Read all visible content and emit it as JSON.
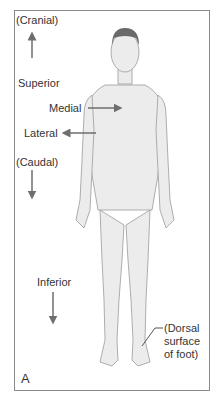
{
  "figure": {
    "panel_label": "A",
    "labels": {
      "cranial": "(Cranial)",
      "superior": "Superior",
      "medial": "Medial",
      "lateral": "Lateral",
      "caudal": "(Caudal)",
      "inferior": "Inferior",
      "dorsal_line1": "(Dorsal",
      "dorsal_line2": "surface",
      "dorsal_line3": "of foot)"
    },
    "colors": {
      "arrow": "#6e6e6e",
      "skin": "#ececec",
      "outline": "#9a9a9a",
      "hair": "#6a6a6a",
      "frame": "#8a8a8a"
    }
  }
}
